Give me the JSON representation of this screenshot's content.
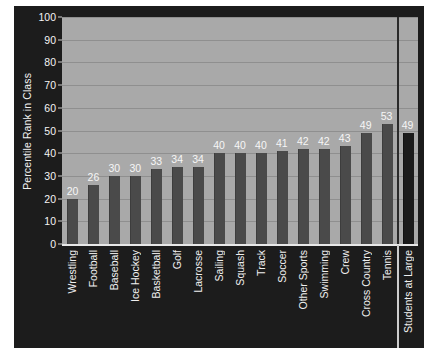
{
  "chart_data": {
    "type": "bar",
    "title": "",
    "xlabel": "",
    "ylabel": "Percentile Rank in Class",
    "ylim": [
      0,
      100
    ],
    "ytick_labels": [
      "0",
      "10",
      "20",
      "30",
      "40",
      "50",
      "60",
      "70",
      "80",
      "90",
      "100"
    ],
    "ytick_values": [
      0,
      10,
      20,
      30,
      40,
      50,
      60,
      70,
      80,
      90,
      100
    ],
    "grid": "horizontal",
    "legend": "none",
    "categories": [
      "Wrestling",
      "Football",
      "Baseball",
      "Ice Hockey",
      "Basketball",
      "Golf",
      "Lacrosse",
      "Sailing",
      "Squash",
      "Track",
      "Soccer",
      "Other Sports",
      "Swimming",
      "Crew",
      "Cross Country",
      "Tennis",
      "Students at Large"
    ],
    "values": [
      20,
      26,
      30,
      30,
      33,
      34,
      34,
      40,
      40,
      40,
      41,
      42,
      42,
      43,
      49,
      53,
      49
    ],
    "data_labels": [
      "20",
      "26",
      "30",
      "30",
      "33",
      "34",
      "34",
      "40",
      "40",
      "40",
      "41",
      "42",
      "42",
      "43",
      "49",
      "53",
      "49"
    ],
    "highlight_index": 16,
    "annotations": [
      "vertical separator line before 'Students at Large'"
    ],
    "colors": {
      "figure_background": "#1c1c1c",
      "plot_background": "#a9a9a9",
      "gridline": "#8f8f8f",
      "bar": "#4a4a4a",
      "bar_highlight": "#1b1b1b",
      "text": "#f2f2f2",
      "axis": "#e8e8e8"
    }
  }
}
